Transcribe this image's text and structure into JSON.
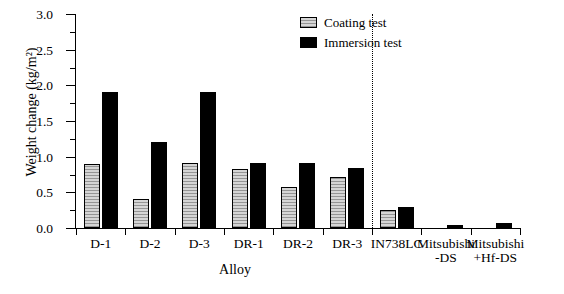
{
  "chart_data": {
    "type": "bar",
    "title": "",
    "xlabel": "Alloy",
    "ylabel": "Weight change (kg/m²)",
    "ylim": [
      0.0,
      3.0
    ],
    "ytick_labels": [
      "0.0",
      "0.5",
      "1.0",
      "1.5",
      "2.0",
      "2.5",
      "3.0"
    ],
    "ytick_values": [
      0.0,
      0.5,
      1.0,
      1.5,
      2.0,
      2.5,
      3.0
    ],
    "grid": false,
    "legend_position": "top-center",
    "categories": [
      "D-1",
      "D-2",
      "D-3",
      "DR-1",
      "DR-2",
      "DR-3",
      "IN738LC",
      "Mitsubishi\n-DS",
      "Mitsubishi\n+Hf-DS"
    ],
    "category_lines": [
      [
        "D-1",
        ""
      ],
      [
        "D-2",
        ""
      ],
      [
        "D-3",
        ""
      ],
      [
        "DR-1",
        ""
      ],
      [
        "DR-2",
        ""
      ],
      [
        "DR-3",
        ""
      ],
      [
        "IN738LC",
        ""
      ],
      [
        "Mitsubishi",
        "-DS"
      ],
      [
        "Mitsubishi",
        "+Hf-DS"
      ]
    ],
    "series": [
      {
        "name": "Coating test",
        "color": "#d5d5d5",
        "values": [
          0.9,
          0.41,
          0.91,
          0.83,
          0.57,
          0.72,
          0.25,
          0.0,
          0.0
        ]
      },
      {
        "name": "Immersion test",
        "color": "#000000",
        "values": [
          1.9,
          1.2,
          1.91,
          0.91,
          0.91,
          0.84,
          0.3,
          0.04,
          0.07
        ]
      }
    ],
    "divider_after_category": "DR-3"
  },
  "legend": {
    "entries": [
      {
        "label": "Coating test"
      },
      {
        "label": "Immersion test"
      }
    ]
  }
}
